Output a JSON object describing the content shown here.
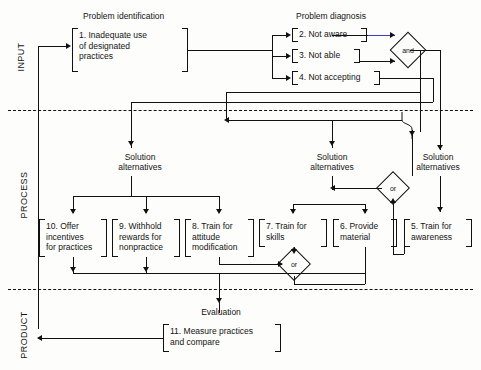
{
  "diagram": {
    "bands": [
      {
        "id": "input",
        "label": "INPUT"
      },
      {
        "id": "process",
        "label": "PROCESS"
      },
      {
        "id": "product",
        "label": "PRODUCT"
      }
    ],
    "section_headers": [
      {
        "id": "problem-identification",
        "label": "Problem identification"
      },
      {
        "id": "problem-diagnosis",
        "label": "Problem diagnosis"
      }
    ],
    "stage_labels": [
      {
        "id": "solution-alternatives-left",
        "label": "Solution\nalternatives"
      },
      {
        "id": "solution-alternatives-middle",
        "label": "Solution\nalternatives"
      },
      {
        "id": "solution-alternatives-right",
        "label": "Solution\nalternatives"
      },
      {
        "id": "evaluation",
        "label": "Evaluation"
      }
    ],
    "boxes": [
      {
        "id": 1,
        "label": "1. Inadequate use\nof designated\npractices"
      },
      {
        "id": 2,
        "label": "2. Not aware"
      },
      {
        "id": 3,
        "label": "3. Not able"
      },
      {
        "id": 4,
        "label": "4. Not accepting"
      },
      {
        "id": 5,
        "label": "5. Train for\nawareness"
      },
      {
        "id": 6,
        "label": "6. Provide\nmaterial"
      },
      {
        "id": 7,
        "label": "7. Train for\nskills"
      },
      {
        "id": 8,
        "label": "8. Train for\nattitude\nmodification"
      },
      {
        "id": 9,
        "label": "9. Withhold\nrewards for\nnonpractice"
      },
      {
        "id": 10,
        "label": "10. Offer\nincentives\nfor practices"
      },
      {
        "id": 11,
        "label": "11. Measure practices\nand compare"
      }
    ],
    "gates": [
      {
        "id": "and-gate",
        "label": "and"
      },
      {
        "id": "or-gate-right",
        "label": "or"
      },
      {
        "id": "or-gate-left",
        "label": "or"
      }
    ],
    "colors": {
      "ink": "#111111",
      "accent_line": "#3b3bbd",
      "background": "#fdfdfb"
    }
  }
}
